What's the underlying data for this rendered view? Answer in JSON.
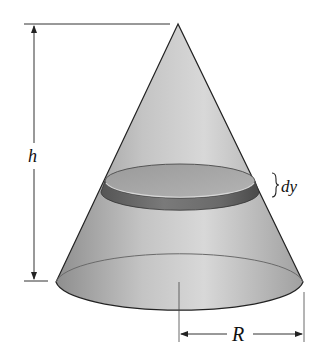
{
  "figure": {
    "labels": {
      "height": "h",
      "slice_thickness": "dy",
      "radius": "R"
    },
    "colors": {
      "background": "#ffffff",
      "cone_light": "#d6d6d6",
      "cone_dark": "#8a8a8a",
      "slice_top": "#a9a9a9",
      "slice_band": "#6e6e6e",
      "outline": "#222222"
    }
  }
}
